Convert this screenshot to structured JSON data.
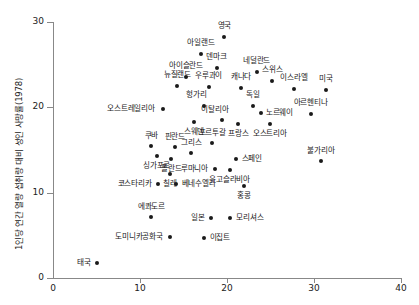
{
  "chart_data": {
    "type": "scatter",
    "title": "",
    "xlabel": "",
    "ylabel": "1인당 연간 열량 섭취량 대비 성인 사망률(1978)",
    "xlim": [
      0,
      40
    ],
    "ylim": [
      0,
      30
    ],
    "xticks": [
      "0",
      "10",
      "20",
      "30",
      "40"
    ],
    "yticks": [
      "0",
      "10",
      "20",
      "30"
    ],
    "grid": false,
    "legend": "none",
    "points": [
      {
        "label": "영국",
        "x": 19.7,
        "y": 28.2
      },
      {
        "label": "아일랜드",
        "x": 17.0,
        "y": 26.3
      },
      {
        "label": "덴마크",
        "x": 18.8,
        "y": 24.6
      },
      {
        "label": "네덜란드",
        "x": 23.4,
        "y": 24.1
      },
      {
        "label": "아이슬란드",
        "x": 15.3,
        "y": 23.6
      },
      {
        "label": "스위스",
        "x": 25.2,
        "y": 23.1
      },
      {
        "label": "뉴질랜드",
        "x": 14.3,
        "y": 22.5
      },
      {
        "label": "우루과이",
        "x": 17.9,
        "y": 22.4
      },
      {
        "label": "캐나다",
        "x": 21.6,
        "y": 22.3
      },
      {
        "label": "이스라엘",
        "x": 27.7,
        "y": 22.2
      },
      {
        "label": "미국",
        "x": 31.4,
        "y": 22.0
      },
      {
        "label": "헝가리",
        "x": 17.3,
        "y": 20.2
      },
      {
        "label": "독일",
        "x": 23.0,
        "y": 20.1
      },
      {
        "label": "오스트레일리아",
        "x": 12.6,
        "y": 19.8
      },
      {
        "label": "노르웨이",
        "x": 23.9,
        "y": 19.3
      },
      {
        "label": "아르헨티나",
        "x": 29.6,
        "y": 19.2
      },
      {
        "label": "이탈리아",
        "x": 19.4,
        "y": 18.5
      },
      {
        "label": "스웨덴",
        "x": 16.2,
        "y": 18.3
      },
      {
        "label": "프랑스",
        "x": 21.3,
        "y": 18.1
      },
      {
        "label": "오스트리아",
        "x": 24.9,
        "y": 18.0
      },
      {
        "label": "포르투갈",
        "x": 18.3,
        "y": 15.8
      },
      {
        "label": "쿠바",
        "x": 11.3,
        "y": 15.5
      },
      {
        "label": "핀란드",
        "x": 14.0,
        "y": 15.4
      },
      {
        "label": "그리스",
        "x": 15.9,
        "y": 14.7
      },
      {
        "label": "폴란드",
        "x": 13.6,
        "y": 14.0
      },
      {
        "label": "싱가포르",
        "x": 11.9,
        "y": 14.3
      },
      {
        "label": "스페인",
        "x": 21.0,
        "y": 13.9
      },
      {
        "label": "불가리아",
        "x": 30.8,
        "y": 13.7
      },
      {
        "label": "루마니아",
        "x": 18.6,
        "y": 12.8
      },
      {
        "label": "유고슬라비아",
        "x": 20.3,
        "y": 12.6
      },
      {
        "label": "칠레",
        "x": 13.4,
        "y": 12.2
      },
      {
        "label": "코스타리카",
        "x": 12.1,
        "y": 11.0
      },
      {
        "label": "베네수엘라",
        "x": 14.1,
        "y": 11.0
      },
      {
        "label": "홍콩",
        "x": 21.9,
        "y": 10.8
      },
      {
        "label": "에콰도르",
        "x": 11.3,
        "y": 7.2
      },
      {
        "label": "일본",
        "x": 18.2,
        "y": 7.0
      },
      {
        "label": "모리셔스",
        "x": 20.4,
        "y": 7.0
      },
      {
        "label": "도미니카공화국",
        "x": 13.4,
        "y": 4.8
      },
      {
        "label": "이집트",
        "x": 17.3,
        "y": 4.7
      },
      {
        "label": "태국",
        "x": 5.1,
        "y": 1.8
      }
    ]
  },
  "label_offsets": [
    {
      "dx": 0,
      "dy": -11,
      "align": "center"
    },
    {
      "dx": 0,
      "dy": -11,
      "align": "center"
    },
    {
      "dx": 0,
      "dy": -11,
      "align": "center"
    },
    {
      "dx": 0,
      "dy": -11,
      "align": "center"
    },
    {
      "dx": 0,
      "dy": -11,
      "align": "center"
    },
    {
      "dx": 0,
      "dy": -11,
      "align": "center"
    },
    {
      "dx": 0,
      "dy": -11,
      "align": "center"
    },
    {
      "dx": 0,
      "dy": -11,
      "align": "center"
    },
    {
      "dx": 0,
      "dy": -11,
      "align": "center"
    },
    {
      "dx": 0,
      "dy": -11,
      "align": "center"
    },
    {
      "dx": 0,
      "dy": -11,
      "align": "center"
    },
    {
      "dx": -7,
      "dy": -11,
      "align": "center"
    },
    {
      "dx": 0,
      "dy": -11,
      "align": "center"
    },
    {
      "dx": -8,
      "dy": 0,
      "align": "right"
    },
    {
      "dx": 5,
      "dy": 0,
      "align": "left"
    },
    {
      "dx": 0,
      "dy": -11,
      "align": "center"
    },
    {
      "dx": -7,
      "dy": -10,
      "align": "center"
    },
    {
      "dx": 0,
      "dy": 10,
      "align": "center"
    },
    {
      "dx": 0,
      "dy": 10,
      "align": "center"
    },
    {
      "dx": 0,
      "dy": 10,
      "align": "center"
    },
    {
      "dx": 0,
      "dy": -10,
      "align": "center"
    },
    {
      "dx": 0,
      "dy": -10,
      "align": "center"
    },
    {
      "dx": 0,
      "dy": -10,
      "align": "center"
    },
    {
      "dx": 0,
      "dy": -10,
      "align": "center"
    },
    {
      "dx": 0,
      "dy": 10,
      "align": "center"
    },
    {
      "dx": 0,
      "dy": 10,
      "align": "center"
    },
    {
      "dx": 6,
      "dy": 0,
      "align": "left"
    },
    {
      "dx": 0,
      "dy": -10,
      "align": "center"
    },
    {
      "dx": -7,
      "dy": 0,
      "align": "right"
    },
    {
      "dx": 0,
      "dy": 10,
      "align": "center"
    },
    {
      "dx": 0,
      "dy": 10,
      "align": "center"
    },
    {
      "dx": -7,
      "dy": 0,
      "align": "right"
    },
    {
      "dx": 6,
      "dy": 0,
      "align": "left"
    },
    {
      "dx": 0,
      "dy": 10,
      "align": "center"
    },
    {
      "dx": 0,
      "dy": -10,
      "align": "center"
    },
    {
      "dx": -7,
      "dy": 0,
      "align": "right"
    },
    {
      "dx": 6,
      "dy": 0,
      "align": "left"
    },
    {
      "dx": -7,
      "dy": 0,
      "align": "right"
    },
    {
      "dx": 6,
      "dy": 0,
      "align": "left"
    },
    {
      "dx": -7,
      "dy": 0,
      "align": "right"
    }
  ]
}
